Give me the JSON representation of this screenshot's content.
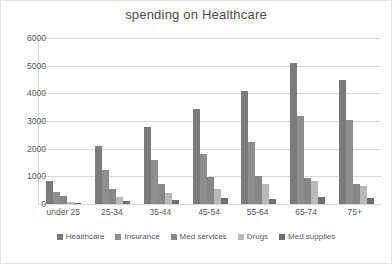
{
  "chart_data": {
    "type": "bar",
    "title": "spending on Healthcare",
    "xlabel": "",
    "ylabel": "",
    "ylim": [
      0,
      6000
    ],
    "yticks": [
      0,
      1000,
      2000,
      3000,
      4000,
      5000,
      6000
    ],
    "grid": true,
    "legend_position": "bottom",
    "categories": [
      "under 25",
      "25-34",
      "35-44",
      "45-54",
      "55-64",
      "65-74",
      "75+"
    ],
    "series": [
      {
        "name": "Healthcare",
        "color": "#7b7b7b",
        "values": [
          840,
          2110,
          2780,
          3430,
          4070,
          5100,
          4490
        ]
      },
      {
        "name": "Insurance",
        "color": "#8e8e8e",
        "values": [
          450,
          1230,
          1600,
          1820,
          2230,
          3180,
          3020
        ]
      },
      {
        "name": "Med services",
        "color": "#878787",
        "values": [
          290,
          560,
          720,
          980,
          1030,
          940,
          710
        ]
      },
      {
        "name": "Drugs",
        "color": "#b9b9b9",
        "values": [
          70,
          250,
          410,
          550,
          730,
          820,
          660
        ]
      },
      {
        "name": "Med supplies",
        "color": "#6f6f6f",
        "values": [
          40,
          110,
          130,
          200,
          190,
          250,
          230
        ]
      }
    ]
  }
}
